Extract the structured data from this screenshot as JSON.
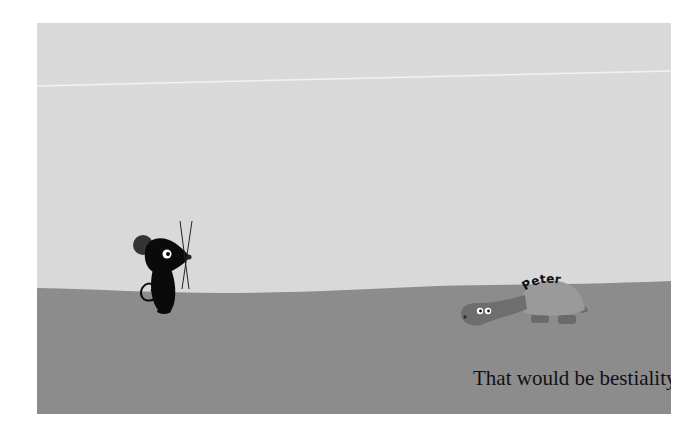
{
  "scene": {
    "caption": "That would be bestiality.",
    "turtle_name": "Peter",
    "colors": {
      "sky": "#d9d9d9",
      "ground": "#8c8c8c",
      "horizon_line": "#f2f2f2",
      "mouse": "#0a0a0a",
      "mouse_ear": "#333333",
      "turtle_shell": "#9a9a9a",
      "turtle_head": "#6e6e6e",
      "turtle_legs": "#6a6a6a"
    },
    "characters": [
      {
        "name": "mouse",
        "role": "speaker"
      },
      {
        "name": "turtle",
        "label": "Peter"
      }
    ]
  }
}
